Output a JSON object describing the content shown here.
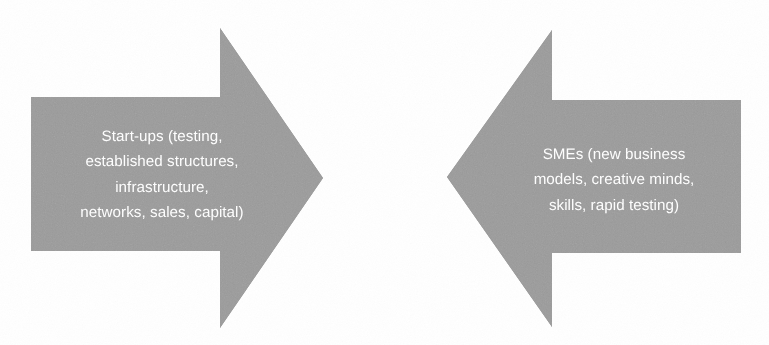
{
  "figure": {
    "type": "diagram",
    "subtype": "two-opposing-block-arrows",
    "background_color": "#ffffff",
    "arrow_fill_color": "#9c9c9c",
    "label_text_color": "#ffffff"
  },
  "arrows": [
    {
      "id": "left-arrow",
      "direction": "right",
      "label": "Start-ups (testing,\nestablished structures,\ninfrastructure,\nnetworks, sales, capital)",
      "label_lines": [
        "Start-ups (testing,",
        "established structures,",
        "infrastructure,",
        "networks, sales, capital)"
      ],
      "fill": "#9c9c9c",
      "points": "31,97 220,97 220,28 323,178 220,328 220,251 31,251"
    },
    {
      "id": "right-arrow",
      "direction": "left",
      "label": "SMEs (new business\nmodels, creative minds,\nskills, rapid testing)",
      "label_lines": [
        "SMEs (new business",
        "models, creative minds,",
        "skills, rapid testing)"
      ],
      "fill": "#9c9c9c",
      "points": "741,100 552,100 552,30 447,177 552,327 552,253 741,253"
    }
  ]
}
